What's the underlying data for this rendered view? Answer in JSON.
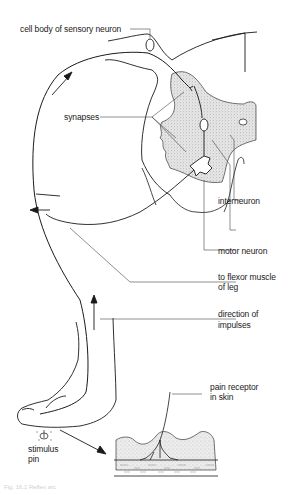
{
  "diagram": {
    "type": "reflex-arc",
    "colors": {
      "line": "#1a1a1a",
      "leader": "#444444",
      "stipple": "#bdbdbd",
      "background": "#ffffff"
    },
    "labels": {
      "cell_body": "cell body of sensory neuron",
      "synapses": "synapses",
      "interneuron": "interneuron",
      "motor_neuron": "motor neuron",
      "flexor_line1": "to flexor muscle",
      "flexor_line2": "of leg",
      "direction_line1": "direction of",
      "direction_line2": "impulses",
      "pain_line1": "pain receptor",
      "pain_line2": "in skin",
      "stimulus_line1": "stimulus",
      "stimulus_line2": "pin"
    },
    "caption": "Fig. 16.1  Reflex arc"
  }
}
